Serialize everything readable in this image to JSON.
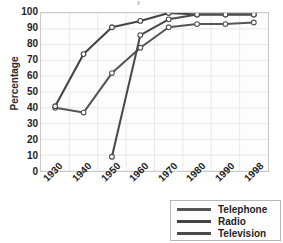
{
  "chart_data": {
    "type": "line",
    "title": "",
    "xlabel": "",
    "ylabel": "Percentage",
    "categories": [
      "1930",
      "1940",
      "1950",
      "1960",
      "1970",
      "1980",
      "1990",
      "1998"
    ],
    "ylim": [
      0,
      100
    ],
    "yticks": [
      "100",
      "90",
      "80",
      "70",
      "60",
      "50",
      "40",
      "30",
      "20",
      "10",
      "0"
    ],
    "grid": true,
    "legend_position": "bottom-right",
    "series": [
      {
        "name": "Telephone",
        "color": "#555555",
        "values": [
          40,
          37,
          62,
          78,
          91,
          93,
          93,
          94
        ]
      },
      {
        "name": "Radio",
        "color": "#444444",
        "values": [
          41,
          74,
          91,
          95,
          100,
          99,
          99,
          99
        ]
      },
      {
        "name": "Television",
        "color": "#4a4a4a",
        "values": [
          null,
          null,
          9,
          86,
          96,
          99,
          99,
          99
        ]
      }
    ]
  },
  "axes": {
    "y_title": "Percentage"
  },
  "legend": {
    "items": [
      {
        "label": "Telephone"
      },
      {
        "label": "Radio"
      },
      {
        "label": "Television"
      }
    ]
  },
  "colors": {
    "plot_background": "#fdfdfd",
    "grid": "#e8e8e8",
    "frame": "#c9c9c9",
    "text": "#1f1f1f",
    "line": "#4a4a4a",
    "marker_fill": "#ffffff"
  }
}
